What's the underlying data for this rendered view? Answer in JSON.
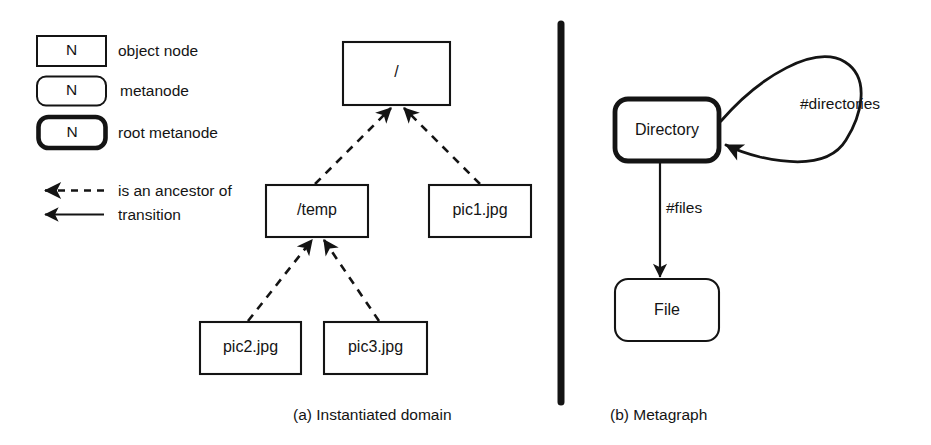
{
  "figure": {
    "background": "#ffffff",
    "ink": "#141414",
    "divider": {
      "name": "panel-divider",
      "x": 561,
      "y1": 24,
      "y2": 402,
      "width": 7
    }
  },
  "legend": {
    "items": [
      {
        "key": "object-node",
        "box_text": "N",
        "label": "object node",
        "shape": "square-rect",
        "stroke": 2.0
      },
      {
        "key": "metanode",
        "box_text": "N",
        "label": "metanode",
        "shape": "rounded-rect",
        "stroke": 2.0
      },
      {
        "key": "root-metanode",
        "box_text": "N",
        "label": "root metanode",
        "shape": "rounded-rect",
        "stroke": 4.6
      },
      {
        "key": "ancestor-edge",
        "box_text": "",
        "label": "is an ancestor of",
        "shape": "dashed-arrow-left",
        "stroke": 2.4
      },
      {
        "key": "transition-edge",
        "box_text": "",
        "label": "transition",
        "shape": "solid-arrow-left",
        "stroke": 2.4
      }
    ]
  },
  "panel_a": {
    "caption": "(a) Instantiated domain",
    "nodes": [
      {
        "id": "root",
        "label": "/",
        "shape": "square-rect"
      },
      {
        "id": "temp",
        "label": "/temp",
        "shape": "square-rect"
      },
      {
        "id": "pic1",
        "label": "pic1.jpg",
        "shape": "square-rect"
      },
      {
        "id": "pic2",
        "label": "pic2.jpg",
        "shape": "square-rect"
      },
      {
        "id": "pic3",
        "label": "pic3.jpg",
        "shape": "square-rect"
      }
    ],
    "edges": [
      {
        "from": "temp",
        "to": "root",
        "style": "dashed",
        "relation": "is an ancestor of"
      },
      {
        "from": "pic1",
        "to": "root",
        "style": "dashed",
        "relation": "is an ancestor of"
      },
      {
        "from": "pic2",
        "to": "temp",
        "style": "dashed",
        "relation": "is an ancestor of"
      },
      {
        "from": "pic3",
        "to": "temp",
        "style": "dashed",
        "relation": "is an ancestor of"
      }
    ]
  },
  "panel_b": {
    "caption": "(b) Metagraph",
    "nodes": [
      {
        "id": "directory",
        "label": "Directory",
        "shape": "rounded-rect",
        "role": "root-metanode"
      },
      {
        "id": "file",
        "label": "File",
        "shape": "rounded-rect",
        "role": "metanode"
      }
    ],
    "edges": [
      {
        "from": "directory",
        "to": "directory",
        "label": "#directories",
        "style": "solid",
        "kind": "self-loop"
      },
      {
        "from": "directory",
        "to": "file",
        "label": "#files",
        "style": "solid",
        "kind": "transition"
      }
    ]
  }
}
